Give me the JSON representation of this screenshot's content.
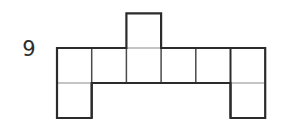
{
  "figure": {
    "label": "9",
    "label_color": "#2e2e2e",
    "background_color": "#ffffff",
    "stroke_color": "#2b2b2b",
    "inner_stroke_color": "#555555",
    "outline_width": 2.2,
    "inner_width": 1.4,
    "square_count": 9,
    "cell_size": 34.7,
    "geometry": {
      "origin_x": 57,
      "origin_y": 48,
      "columns": 6,
      "column_edges": [
        57,
        91.7,
        126.4,
        161.1,
        195.8,
        230.5,
        265.2
      ],
      "row_edges": [
        13.3,
        48,
        83,
        118
      ],
      "main_row": {
        "x": 57,
        "y": 48,
        "width": 208.2,
        "height": 35
      },
      "top_square": {
        "x": 126.4,
        "y": 13.3,
        "width": 34.7,
        "height": 34.7,
        "column_index": 2
      },
      "bottom_left_square": {
        "x": 57,
        "y": 83,
        "width": 34.7,
        "height": 35,
        "column_index": 0
      },
      "bottom_right_square": {
        "x": 230.5,
        "y": 83,
        "width": 34.7,
        "height": 35,
        "column_index": 5
      }
    },
    "outline_path": "M 57 48 L 126.4 48 L 126.4 13.3 L 161.1 13.3 L 161.1 48 L 265.2 48 L 265.2 118 L 230.5 118 L 230.5 83 L 91.7 83 L 91.7 118 L 57 118 Z",
    "inner_lines": [
      {
        "name": "vertical-divider-1",
        "x1": 91.7,
        "y1": 48,
        "x2": 91.7,
        "y2": 83
      },
      {
        "name": "vertical-divider-2",
        "x1": 126.4,
        "y1": 48,
        "x2": 126.4,
        "y2": 83
      },
      {
        "name": "vertical-divider-3",
        "x1": 161.1,
        "y1": 48,
        "x2": 161.1,
        "y2": 83
      },
      {
        "name": "vertical-divider-4",
        "x1": 195.8,
        "y1": 48,
        "x2": 195.8,
        "y2": 83
      },
      {
        "name": "vertical-divider-5",
        "x1": 230.5,
        "y1": 48,
        "x2": 230.5,
        "y2": 118
      },
      {
        "name": "horizontal-divider-left",
        "x1": 57,
        "y1": 83,
        "x2": 91.7,
        "y2": 83
      },
      {
        "name": "horizontal-divider-main",
        "x1": 91.7,
        "y1": 83,
        "x2": 230.5,
        "y2": 83
      },
      {
        "name": "horizontal-divider-right",
        "x1": 230.5,
        "y1": 83,
        "x2": 265.2,
        "y2": 83
      },
      {
        "name": "vertical-divider-left-lower",
        "x1": 91.7,
        "y1": 83,
        "x2": 91.7,
        "y2": 118
      }
    ]
  }
}
